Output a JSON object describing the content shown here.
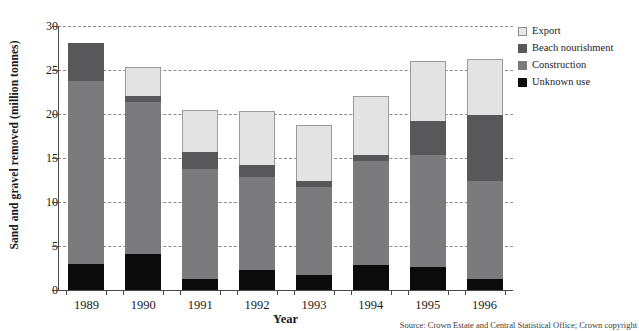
{
  "chart_data": {
    "type": "bar",
    "stacked": true,
    "title": "",
    "xlabel": "Year",
    "ylabel": "Sand and gravel removed (million tonnes)",
    "categories": [
      "1989",
      "1990",
      "1991",
      "1992",
      "1993",
      "1994",
      "1995",
      "1996"
    ],
    "ylim": [
      0,
      30
    ],
    "yticks": [
      0,
      5,
      10,
      15,
      20,
      25,
      30
    ],
    "ytick_labels": [
      "0",
      "5",
      "10",
      "15",
      "20",
      "25",
      "30"
    ],
    "grid": true,
    "grid_axis": "y",
    "grid_style": "dashed",
    "legend_position": "right",
    "stack_order_bottom_to_top": [
      "Unknown use",
      "Construction",
      "Beach nourishment",
      "Export"
    ],
    "series": [
      {
        "name": "Unknown use",
        "color": "#0b0b0b",
        "values": [
          3.0,
          4.1,
          1.3,
          2.3,
          1.7,
          2.8,
          2.6,
          1.2
        ]
      },
      {
        "name": "Construction",
        "color": "#7b7b7d",
        "values": [
          20.7,
          17.3,
          12.5,
          10.5,
          10.0,
          11.9,
          12.7,
          11.2
        ]
      },
      {
        "name": "Beach nourishment",
        "color": "#58585a",
        "values": [
          4.4,
          0.6,
          1.9,
          1.4,
          0.7,
          0.6,
          3.9,
          7.5
        ]
      },
      {
        "name": "Export",
        "color": "#e3e3e3",
        "values": [
          0.0,
          3.3,
          4.7,
          6.2,
          6.3,
          6.7,
          6.8,
          6.4
        ]
      }
    ],
    "totals": [
      28.1,
      25.3,
      20.4,
      20.4,
      18.7,
      22.0,
      26.0,
      26.3
    ]
  },
  "legend": {
    "items": [
      {
        "label": "Export",
        "swatch": "export-swatch"
      },
      {
        "label": "Beach nourishment",
        "swatch": "beach-nourishment-swatch"
      },
      {
        "label": "Construction",
        "swatch": "construction-swatch"
      },
      {
        "label": "Unknown use",
        "swatch": "unknown-use-swatch"
      }
    ]
  },
  "source": {
    "text": "Source: Crown Estate and Central Statistical Office; Crown copyright"
  }
}
